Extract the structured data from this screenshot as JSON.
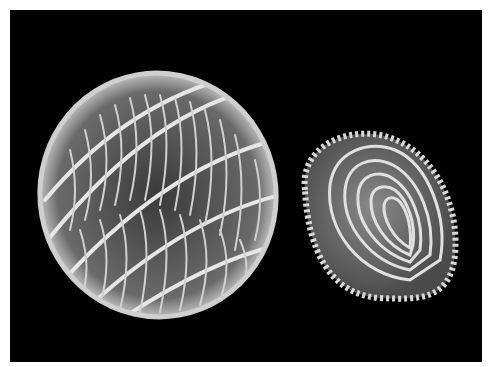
{
  "image": {
    "subject": "Two microfossil shells photographed on black background",
    "background_color": "#000000",
    "border_color": "#ffffff",
    "objects": [
      {
        "name": "spherical-reticulate-shell",
        "position": "left",
        "shade": "#d9d9d9"
      },
      {
        "name": "oval-concentric-shell",
        "position": "right",
        "shade": "#c8c8c8"
      }
    ]
  }
}
